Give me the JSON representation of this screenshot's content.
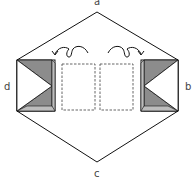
{
  "labels": {
    "top": "a",
    "right": "b",
    "bottom": "c",
    "left": "d"
  },
  "colors": {
    "stroke": "#111111",
    "shade_dark": "#888888",
    "shade_light": "#bbbbbb",
    "fill": "#ffffff",
    "dashed": "#555555"
  },
  "elements": {
    "outline": "hexagon",
    "left_fold": "shaded-triangular-fold",
    "right_fold": "shaded-triangular-fold",
    "dashed_panels": 2,
    "arrows": [
      "fold-arrow-left",
      "fold-arrow-right"
    ]
  }
}
